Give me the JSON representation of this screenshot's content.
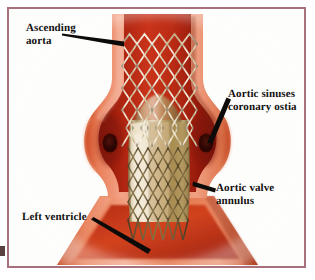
{
  "figure": {
    "alt": "Cutaway illustration of the aortic root with a self-expanding nitinol stent valve deployed across the aortic valve annulus",
    "background_color": "#fdfdfc",
    "frame_color": "#a8707a"
  },
  "labels": [
    {
      "id": "ascending-aorta",
      "text": "Ascending\naorta",
      "line1": "Ascending",
      "line2": "aorta",
      "arrow_direction": "right-down",
      "points_to": "ascending-aorta-wall"
    },
    {
      "id": "aortic-sinuses-coronary-ostia",
      "text": "Aortic sinuses\ncoronary ostia",
      "line1": "Aortic sinuses",
      "line2": "coronary ostia",
      "arrow_direction": "left-down",
      "points_to": "right-coronary-ostium"
    },
    {
      "id": "aortic-valve-annulus",
      "text": "Aortic valve\nannulus",
      "line1": "Aortic valve",
      "line2": "annulus",
      "arrow_direction": "left-down",
      "points_to": "annulus-region"
    },
    {
      "id": "left-ventricle",
      "text": "Left  ventricle",
      "line1": "Left  ventricle",
      "line2": "",
      "arrow_direction": "right-down",
      "points_to": "left-ventricle-outflow-tract"
    }
  ],
  "anatomy": {
    "aortic_wall_outer_color": "#e0datain",
    "aortic_wall_color": "#e2724f",
    "aortic_wall_highlight": "#f0a183",
    "aortic_lumen_color": "#a81f10",
    "sinus_shadow_color": "#8e1a0d",
    "coronary_ostium_color": "#3a0a06",
    "left_ventricle_color": "#d6542f",
    "parts": [
      "ascending aorta",
      "aortic sinuses",
      "coronary ostia",
      "aortic valve annulus",
      "left ventricle"
    ]
  },
  "device": {
    "name": "self-expanding stent valve",
    "stent_mesh_color": "#d8cdb4",
    "stent_mesh_shadow": "#7d6c4e",
    "leaflet_cream_color": "#efe6d2",
    "leaflet_tan_color": "#c9ab78",
    "leaflet_olive_color": "#a8914f",
    "cell_pattern": "diamond"
  }
}
